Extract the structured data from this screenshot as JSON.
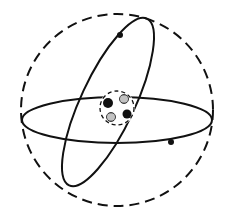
{
  "diagram": {
    "type": "atom-model",
    "colors": {
      "line": "#111111",
      "background": "#ffffff",
      "neutron_fill": "#9a9a9a"
    },
    "outer_shell": {
      "style": "dashed",
      "cx": 117,
      "cy": 110,
      "r": 96
    },
    "orbits": [
      {
        "name": "horizontal-orbit",
        "cx": 117,
        "cy": 120,
        "rx": 95,
        "ry": 23,
        "rotate": 0
      },
      {
        "name": "tilted-orbit",
        "cx": 108,
        "cy": 102,
        "rx": 27,
        "ry": 92,
        "rotate": 25
      }
    ],
    "nucleus": {
      "boundary": {
        "style": "dashed",
        "cx": 117,
        "cy": 108,
        "r": 17
      },
      "particles": [
        {
          "kind": "proton",
          "cx": 108,
          "cy": 103,
          "r": 5
        },
        {
          "kind": "neutron",
          "cx": 124,
          "cy": 99,
          "r": 4.5
        },
        {
          "kind": "neutron",
          "cx": 111,
          "cy": 117,
          "r": 4.5
        },
        {
          "kind": "proton",
          "cx": 127,
          "cy": 114,
          "r": 4.5
        }
      ]
    },
    "electrons": [
      {
        "cx": 120,
        "cy": 35,
        "r": 3
      },
      {
        "cx": 171,
        "cy": 142,
        "r": 3
      }
    ]
  }
}
